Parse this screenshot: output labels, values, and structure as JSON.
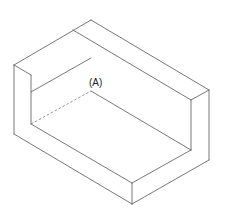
{
  "diagram": {
    "type": "isometric-technical-drawing",
    "labels": [
      {
        "id": "A",
        "text": "(A)",
        "x": 89,
        "y": 86
      }
    ],
    "colors": {
      "line": "#555555",
      "hidden_line": "#777777",
      "text": "#222222",
      "background": "#ffffff"
    }
  }
}
